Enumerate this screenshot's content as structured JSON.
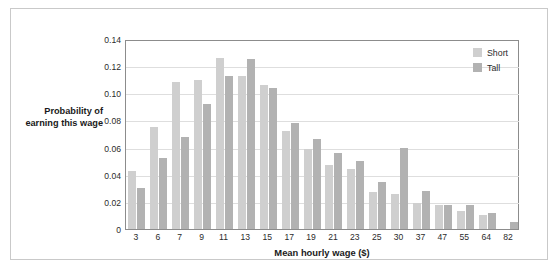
{
  "chart_data": {
    "type": "bar",
    "title": "",
    "xlabel": "Mean hourly wage ($)",
    "ylabel": "Probability of earning this wage",
    "ylim": [
      0,
      0.14
    ],
    "ytick_labels": [
      "0.14",
      "0.12",
      "0.10",
      "0.08",
      "0.06",
      "0.04",
      "0.02",
      "0"
    ],
    "ytick_values": [
      0.14,
      0.12,
      0.1,
      0.08,
      0.06,
      0.04,
      0.02,
      0
    ],
    "grid": true,
    "legend_position": "top-right",
    "categories": [
      "3",
      "6",
      "7",
      "9",
      "11",
      "13",
      "15",
      "17",
      "19",
      "21",
      "23",
      "25",
      "30",
      "37",
      "47",
      "55",
      "64",
      "82"
    ],
    "series": [
      {
        "name": "Short",
        "color": "#cfcfcf",
        "values": [
          0.043,
          0.075,
          0.108,
          0.11,
          0.126,
          0.113,
          0.106,
          0.072,
          0.059,
          0.047,
          0.044,
          0.027,
          0.026,
          0.019,
          0.018,
          0.013,
          0.01,
          0.0
        ]
      },
      {
        "name": "Tall",
        "color": "#b2b2b2",
        "values": [
          0.03,
          0.052,
          0.068,
          0.092,
          0.113,
          0.125,
          0.104,
          0.078,
          0.066,
          0.056,
          0.05,
          0.035,
          0.06,
          0.028,
          0.018,
          0.018,
          0.012,
          0.005
        ]
      }
    ]
  },
  "axes": {
    "y_title": "Probability of earning this wage",
    "x_title": "Mean hourly wage ($)"
  },
  "legend": {
    "items": [
      {
        "label": "Short",
        "swatch": "short"
      },
      {
        "label": "Tall",
        "swatch": "tall"
      }
    ]
  }
}
